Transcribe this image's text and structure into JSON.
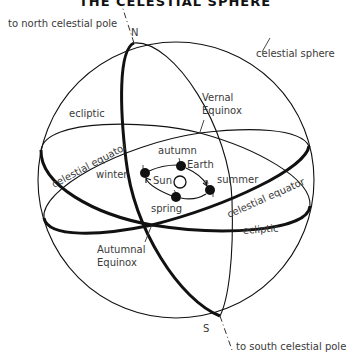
{
  "title": "THE CELESTIAL SPHERE",
  "labels": {
    "north_pole_pointer": "to north celestial pole",
    "north": "N",
    "south": "S",
    "south_pole_pointer": "to south celestial pole",
    "celestial_sphere": "celestial sphere",
    "ecliptic_upper": "ecliptic",
    "ecliptic_lower": "ecliptic",
    "celestial_equator_left": "celestial equator",
    "celestial_equator_right": "celestial equator",
    "vernal_equinox_line1": "Vernal",
    "vernal_equinox_line2": "Equinox",
    "autumnal_equinox_line1": "Autumnal",
    "autumnal_equinox_line2": "Equinox",
    "sun": "Sun",
    "earth": "Earth",
    "season_winter": "winter",
    "season_autumn": "autumn",
    "season_summer": "summer",
    "season_spring": "spring"
  },
  "colors": {
    "line": "#111111",
    "text": "#3a3a3a",
    "background": "#ffffff"
  }
}
